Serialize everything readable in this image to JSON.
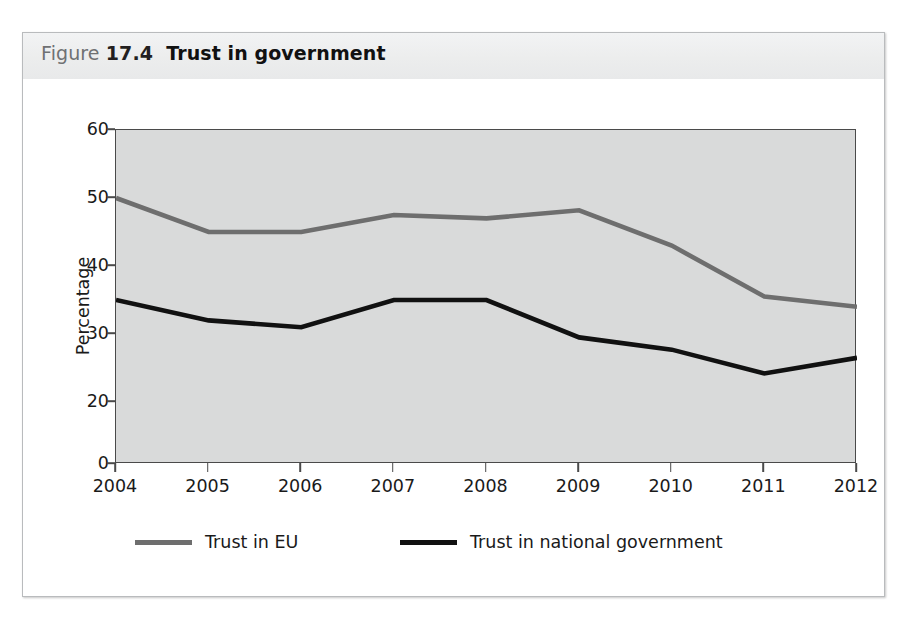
{
  "figure": {
    "label_word": "Figure",
    "number": "17.4",
    "title": "Trust in government"
  },
  "chart_data": {
    "type": "line",
    "title": "Trust in government",
    "xlabel": "",
    "ylabel": "Percentage",
    "categories": [
      "2004",
      "2005",
      "2006",
      "2007",
      "2008",
      "2009",
      "2010",
      "2011",
      "2012"
    ],
    "x": [
      2004,
      2005,
      2006,
      2007,
      2008,
      2009,
      2010,
      2011,
      2012
    ],
    "series": [
      {
        "name": "Trust in EU",
        "color": "#6e6e6e",
        "values": [
          50.0,
          45.0,
          45.0,
          47.5,
          47.0,
          48.2,
          43.0,
          35.5,
          34.0
        ]
      },
      {
        "name": "Trust in national government",
        "color": "#111111",
        "values": [
          35.0,
          32.0,
          31.0,
          35.0,
          35.0,
          29.5,
          27.7,
          24.2,
          26.5
        ]
      }
    ],
    "ylim": [
      0,
      60
    ],
    "yticks": [
      0,
      20,
      30,
      40,
      50,
      60
    ],
    "ytick_labels": [
      "0",
      "20",
      "30",
      "40",
      "50",
      "60"
    ],
    "grid": false,
    "legend_position": "bottom",
    "plot_background": "#d9dada"
  },
  "legend": {
    "items": [
      {
        "label": "Trust in EU",
        "color": "#6e6e6e"
      },
      {
        "label": "Trust in national government",
        "color": "#111111"
      }
    ]
  }
}
